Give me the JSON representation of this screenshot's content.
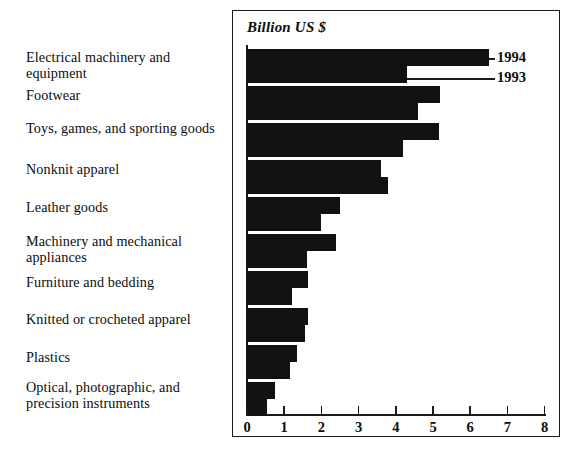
{
  "chart_data": {
    "type": "bar",
    "orientation": "horizontal",
    "title": "",
    "unit_label": "Billion US $",
    "xlabel": "",
    "ylabel": "",
    "xlim": [
      0,
      8
    ],
    "xticks": [
      "0",
      "1",
      "2",
      "3",
      "4",
      "5",
      "6",
      "7",
      "8"
    ],
    "grid": false,
    "legend_position": "right-top",
    "categories": [
      "Electrical machinery and equipment",
      "Footwear",
      "Toys, games, and sporting goods",
      "Nonknit apparel",
      "Leather goods",
      "Machinery and mechanical appliances",
      "Furniture and bedding",
      "Knitted or crocheted apparel",
      "Plastics",
      "Optical, photographic, and precision instruments"
    ],
    "series": [
      {
        "name": "1994",
        "values": [
          6.5,
          5.2,
          5.15,
          3.6,
          2.5,
          2.4,
          1.65,
          1.65,
          1.35,
          0.75
        ]
      },
      {
        "name": "1993",
        "values": [
          4.3,
          4.6,
          4.2,
          3.8,
          2.0,
          1.6,
          1.2,
          1.55,
          1.15,
          0.55
        ]
      }
    ],
    "colors": {
      "bar": "#111111",
      "axis": "#1a1a1a",
      "background": "#ffffff",
      "text": "#0d0d0d"
    }
  },
  "legend": {
    "entries": [
      {
        "label": "1994"
      },
      {
        "label": "1993"
      }
    ]
  },
  "axis": {
    "unit_caption": "Billion US $"
  }
}
